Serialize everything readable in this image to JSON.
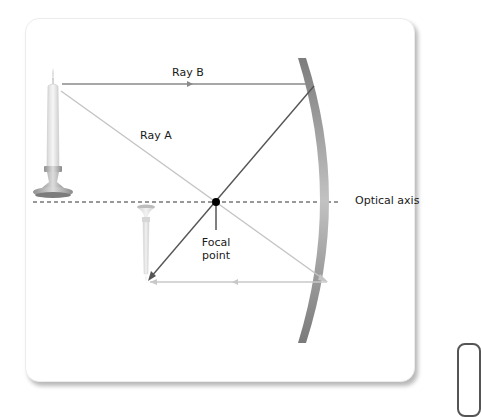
{
  "diagram": {
    "labels": {
      "ray_a": "Ray A",
      "ray_b": "Ray B",
      "optical_axis": "Optical axis",
      "focal_point_line1": "Focal",
      "focal_point_line2": "point"
    },
    "colors": {
      "ray_incoming": "#8a8a8a",
      "ray_light": "#c4c4c4",
      "ray_reflected_dark": "#555555",
      "mirror": "#9a9a9a",
      "focal_dot": "#000000",
      "axis": "#333333"
    }
  }
}
